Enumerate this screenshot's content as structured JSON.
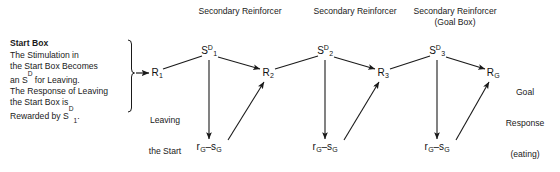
{
  "figure": {
    "line_color": "#1a1a1a",
    "text_color": "#1a1a1a"
  },
  "top_labels": [
    {
      "text": "Secondary Reinforcer",
      "x": 240,
      "y": 6
    },
    {
      "text": "Secondary Reinforcer",
      "x": 355,
      "y": 6
    },
    {
      "text": "Secondary Reinforcer",
      "x": 455,
      "y": 6
    },
    {
      "text": "(Goal Box)",
      "x": 455,
      "y": 17
    }
  ],
  "side_panel": {
    "heading": "Start Box",
    "line1": "The Stimulation in",
    "line2": "the Start Box Becomes",
    "line3_a": "an S",
    "line3_sup": "D",
    "line3_b": " for Leaving.",
    "line4": "The Response of Leaving",
    "line5": "the Start Box is",
    "line6_a": "Rewarded by S",
    "line6_sup": "D",
    "line6_sub": "1",
    "line6_b": "."
  },
  "nodes": [
    {
      "id": "R1",
      "base": "R",
      "sub": "1",
      "sup": "",
      "x": 157,
      "y": 73
    },
    {
      "id": "SD1",
      "base": "S",
      "sub": "1",
      "sup": "D",
      "x": 209,
      "y": 51
    },
    {
      "id": "R2",
      "base": "R",
      "sub": "2",
      "sup": "",
      "x": 268,
      "y": 73
    },
    {
      "id": "SD2",
      "base": "S",
      "sub": "2",
      "sup": "D",
      "x": 325,
      "y": 51
    },
    {
      "id": "R3",
      "base": "R",
      "sub": "3",
      "sup": "",
      "x": 383,
      "y": 73
    },
    {
      "id": "SD3",
      "base": "S",
      "sub": "3",
      "sup": "D",
      "x": 437,
      "y": 51
    },
    {
      "id": "RG",
      "base": "R",
      "sub": "G",
      "sup": "",
      "x": 493,
      "y": 73
    }
  ],
  "mediator_nodes": [
    {
      "id": "rg-sg-1",
      "text": "r G – s G",
      "left": "r",
      "sub_left": "G",
      "dash": "–",
      "right": "s",
      "sub_right": "G",
      "x": 209,
      "y": 147
    },
    {
      "id": "rg-sg-2",
      "text": "r G – s G",
      "left": "r",
      "sub_left": "G",
      "dash": "–",
      "right": "s",
      "sub_right": "G",
      "x": 325,
      "y": 147
    },
    {
      "id": "rg-sg-3",
      "text": "r G – s G",
      "left": "r",
      "sub_left": "G",
      "dash": "–",
      "right": "s",
      "sub_right": "G",
      "x": 437,
      "y": 147
    }
  ],
  "annotations": [
    {
      "id": "leaving-start-box",
      "line1": "Leaving",
      "line2": "the Start",
      "line3": "Box",
      "x": 165,
      "y": 94
    },
    {
      "id": "goal-response",
      "line1": "Goal",
      "line2": "Response",
      "line3": "(eating)",
      "x": 525,
      "y": 66
    }
  ]
}
